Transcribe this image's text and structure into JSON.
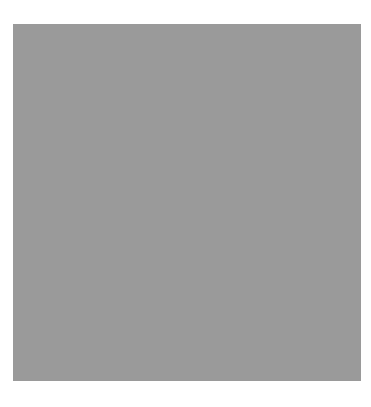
{
  "puzzle": {
    "rows": 15,
    "cols": 15,
    "colors": {
      "block": "#0a0a0a",
      "open": "#ffffff",
      "gridline": "#9a9a9a",
      "number": "#3a3a3a"
    },
    "layout": [
      "###...........###",
      "x"
    ],
    "grid": [
      "###........####",
      "#"
    ]
  }
}
